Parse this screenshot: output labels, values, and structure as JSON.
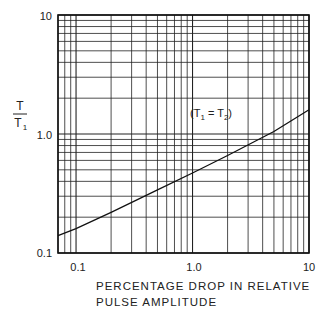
{
  "chart_data": {
    "type": "line",
    "title": "",
    "xlabel": "PERCENTAGE DROP IN RELATIVE PULSE AMPLITUDE",
    "xlabel_lines": [
      "PERCENTAGE DROP IN RELATIVE",
      "PULSE AMPLITUDE"
    ],
    "ylabel": "T / T1",
    "ylabel_num": "T",
    "ylabel_den": "T",
    "ylabel_den_sub": "1",
    "x_scale": "log",
    "y_scale": "log",
    "xlim": [
      0.07,
      10
    ],
    "ylim": [
      0.1,
      10
    ],
    "x_ticks": [
      {
        "value": 0.1,
        "label": "0.1"
      },
      {
        "value": 1.0,
        "label": "1.0"
      },
      {
        "value": 10,
        "label": "10"
      }
    ],
    "y_ticks": [
      {
        "value": 0.1,
        "label": "0.1"
      },
      {
        "value": 1.0,
        "label": "1.0"
      },
      {
        "value": 10,
        "label": "10"
      }
    ],
    "grid": true,
    "series": [
      {
        "name": "T1 = T2",
        "x": [
          0.07,
          0.1,
          0.2,
          0.5,
          1.0,
          2.0,
          5.0,
          10
        ],
        "y": [
          0.14,
          0.16,
          0.22,
          0.34,
          0.47,
          0.66,
          1.05,
          1.6
        ]
      }
    ],
    "annotations": [
      {
        "text": "(T1 = T2)",
        "x": 1.2,
        "y": 2.0
      }
    ]
  },
  "annotation": {
    "open": "(T",
    "sub1": "1",
    "eq": " = T",
    "sub2": "2",
    "close": ")"
  }
}
